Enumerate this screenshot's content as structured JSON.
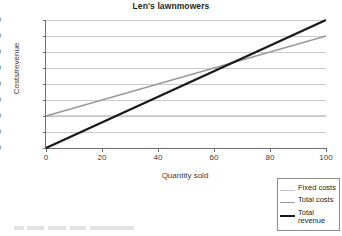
{
  "chart_data": {
    "type": "line",
    "title": "Len's lawnmowers",
    "xlabel": "Quantity sold",
    "ylabel": "Costs/revenue",
    "xlim": [
      0,
      100
    ],
    "ylim": [
      0,
      8000
    ],
    "xticks": [
      "0",
      "20",
      "40",
      "60",
      "80",
      "100"
    ],
    "yticks": [
      "0",
      "1000",
      "2000",
      "3000",
      "4000",
      "5000",
      "6000",
      "7000",
      "8000"
    ],
    "grid": "horizontal",
    "legend_position": "bottom-right",
    "x": [
      0,
      100
    ],
    "series": [
      {
        "name": "Fixed costs",
        "values": [
          2000,
          2000
        ],
        "color": "#c4c4c4",
        "width": 1.6
      },
      {
        "name": "Total costs",
        "values": [
          2000,
          7000
        ],
        "color": "#9a9a9a",
        "width": 1.8
      },
      {
        "name": "Total revenue",
        "values": [
          0,
          8000
        ],
        "color": "#1a1a1a",
        "width": 2.4
      }
    ],
    "annotations": {
      "breakeven_quantity": 63,
      "breakeven_value": 5000
    }
  },
  "legend": {
    "items": [
      {
        "label": "Fixed costs"
      },
      {
        "label": "Total costs"
      },
      {
        "label": "Total revenue"
      }
    ]
  }
}
